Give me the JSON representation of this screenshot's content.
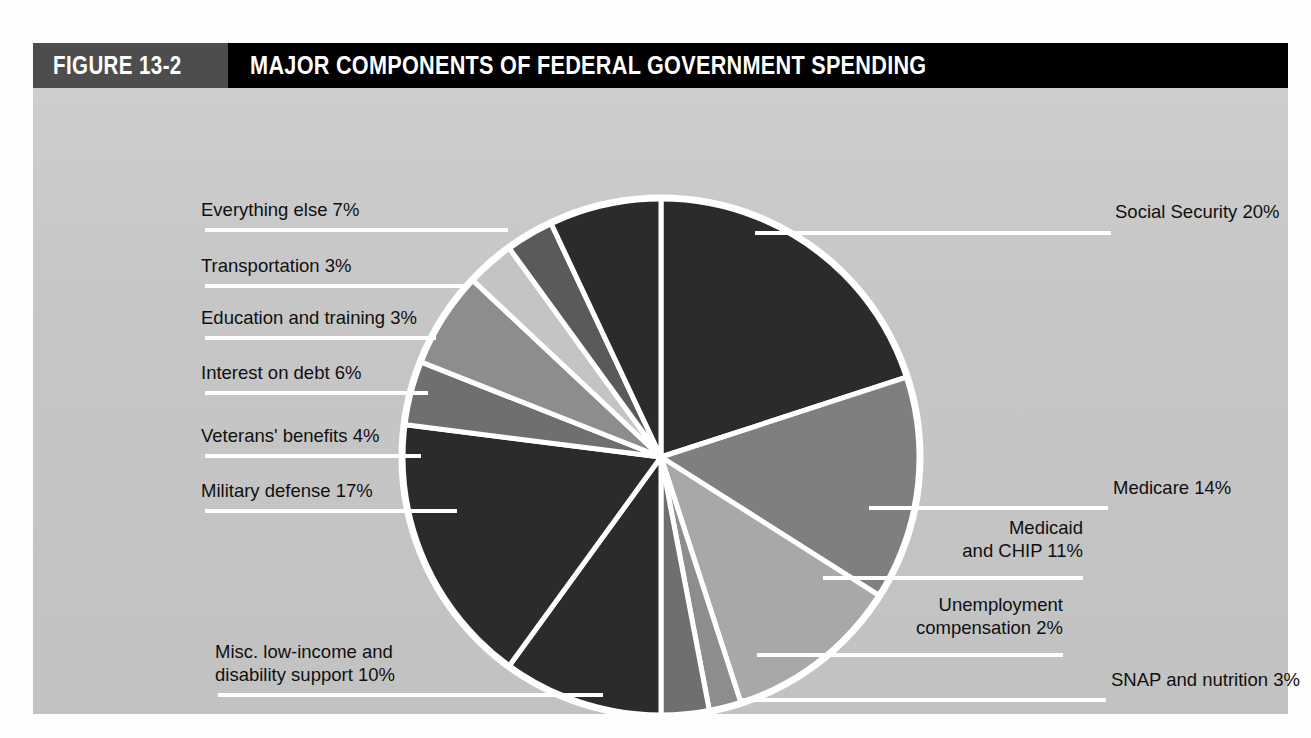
{
  "figure": {
    "number": "FIGURE 13-2",
    "title": "MAJOR COMPONENTS OF FEDERAL GOVERNMENT SPENDING"
  },
  "colors": {
    "header_bar": "#000000",
    "number_block": "#4d4d4d",
    "panel_background": "#c9c9c9",
    "slice_outline": "#ffffff",
    "label_text": "#101010"
  },
  "chart_data": {
    "type": "pie",
    "title": "MAJOR COMPONENTS OF FEDERAL GOVERNMENT SPENDING",
    "unit": "percent",
    "start_angle_deg": -90,
    "direction": "clockwise",
    "total": 100,
    "legend_position": "callout-labels",
    "labels": [
      "Social Security 20%",
      "Medicare 14%",
      "Medicaid and CHIP 11%",
      "Unemployment compensation 2%",
      "SNAP and nutrition 3%",
      "Misc. low-income and disability support 10%",
      "Military defense 17%",
      "Veterans' benefits 4%",
      "Interest on debt 6%",
      "Education and training 3%",
      "Transportation 3%",
      "Everything else 7%"
    ],
    "categories": [
      "Social Security",
      "Medicare",
      "Medicaid and CHIP",
      "Unemployment compensation",
      "SNAP and nutrition",
      "Misc. low-income and disability support",
      "Military defense",
      "Veterans' benefits",
      "Interest on debt",
      "Education and training",
      "Transportation",
      "Everything else"
    ],
    "values": [
      20,
      14,
      11,
      2,
      3,
      10,
      17,
      4,
      6,
      3,
      3,
      7
    ],
    "slice_colors": [
      "#2b2b2b",
      "#7f7f7f",
      "#a8a8a8",
      "#8d8d8d",
      "#6f6f6f",
      "#2b2b2b",
      "#2b2b2b",
      "#6f6f6f",
      "#8d8d8d",
      "#c4c4c4",
      "#5a5a5a",
      "#2b2b2b"
    ]
  },
  "callouts": {
    "social_security": "Social Security 20%",
    "medicare": "Medicare 14%",
    "medicaid_line1": "Medicaid",
    "medicaid_line2": "and CHIP 11%",
    "unemployment_line1": "Unemployment",
    "unemployment_line2": "compensation 2%",
    "snap": "SNAP and nutrition 3%",
    "misc_line1": "Misc. low-income and",
    "misc_line2": "disability support 10%",
    "military": "Military defense 17%",
    "veterans": "Veterans' benefits 4%",
    "interest": "Interest on debt 6%",
    "education": "Education and training 3%",
    "transportation": "Transportation 3%",
    "everything_else": "Everything else 7%"
  }
}
